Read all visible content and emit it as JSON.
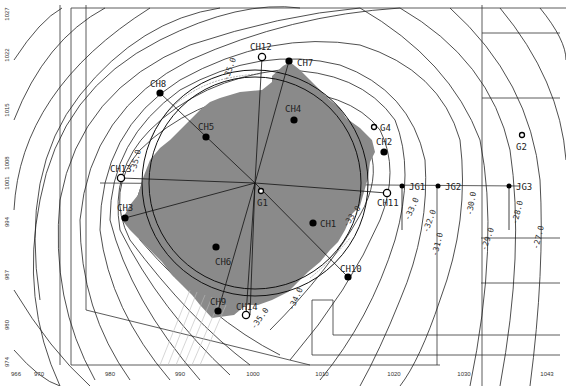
{
  "diagram": {
    "y_axis_ticks": [
      {
        "label": "1027",
        "y": 14
      },
      {
        "label": "1022",
        "y": 55
      },
      {
        "label": "1015",
        "y": 110
      },
      {
        "label": "1008",
        "y": 163
      },
      {
        "label": "1001",
        "y": 183
      },
      {
        "label": "994",
        "y": 222
      },
      {
        "label": "987",
        "y": 275
      },
      {
        "label": "980",
        "y": 325
      },
      {
        "label": "974",
        "y": 362
      }
    ],
    "x_axis_ticks": [
      {
        "label": "966",
        "x": 16
      },
      {
        "label": "970",
        "x": 39
      },
      {
        "label": "980",
        "x": 110
      },
      {
        "label": "990",
        "x": 180
      },
      {
        "label": "1000",
        "x": 253
      },
      {
        "label": "1010",
        "x": 322
      },
      {
        "label": "1020",
        "x": 394
      },
      {
        "label": "1030",
        "x": 464
      },
      {
        "label": "1043",
        "x": 547
      }
    ],
    "contour_labels": [
      {
        "text": "-35.0",
        "x": 232,
        "y": 70,
        "rot": -70
      },
      {
        "text": "-35.0",
        "x": 138,
        "y": 162,
        "rot": -75
      },
      {
        "text": "-33.0",
        "x": 354,
        "y": 218,
        "rot": -55
      },
      {
        "text": "-33.0",
        "x": 414,
        "y": 210,
        "rot": -65
      },
      {
        "text": "-32.0",
        "x": 432,
        "y": 222,
        "rot": -70
      },
      {
        "text": "-31.0",
        "x": 440,
        "y": 245,
        "rot": -75
      },
      {
        "text": "-30.0",
        "x": 474,
        "y": 204,
        "rot": -80
      },
      {
        "text": "-29.0",
        "x": 490,
        "y": 240,
        "rot": -70
      },
      {
        "text": "-28.0",
        "x": 520,
        "y": 213,
        "rot": -75
      },
      {
        "text": "-27.0",
        "x": 541,
        "y": 238,
        "rot": -75
      },
      {
        "text": "-34.0",
        "x": 298,
        "y": 300,
        "rot": -65
      },
      {
        "text": "-35.0",
        "x": 262,
        "y": 320,
        "rot": -55
      }
    ],
    "wells_filled": [
      {
        "name": "CH7",
        "x": 289,
        "y": 61
      },
      {
        "name": "CH8",
        "x": 160,
        "y": 93
      },
      {
        "name": "CH5",
        "x": 206,
        "y": 137
      },
      {
        "name": "CH4",
        "x": 294,
        "y": 120
      },
      {
        "name": "CH2",
        "x": 384,
        "y": 152
      },
      {
        "name": "CH3",
        "x": 125,
        "y": 218
      },
      {
        "name": "CH1",
        "x": 313,
        "y": 223
      },
      {
        "name": "CH6",
        "x": 216,
        "y": 247
      },
      {
        "name": "CH10",
        "x": 348,
        "y": 277
      },
      {
        "name": "CH9",
        "x": 218,
        "y": 311
      },
      {
        "name": "JG1",
        "x": 402,
        "y": 186
      },
      {
        "name": "JG2",
        "x": 438,
        "y": 186
      },
      {
        "name": "JG3",
        "x": 509,
        "y": 186
      }
    ],
    "wells_open": [
      {
        "name": "CH12",
        "x": 262,
        "y": 57
      },
      {
        "name": "CH13",
        "x": 121,
        "y": 178
      },
      {
        "name": "CH11",
        "x": 387,
        "y": 193
      },
      {
        "name": "CH14",
        "x": 246,
        "y": 315
      },
      {
        "name": "G1",
        "x": 261,
        "y": 191
      },
      {
        "name": "G4",
        "x": 374,
        "y": 127
      },
      {
        "name": "G2",
        "x": 522,
        "y": 135
      }
    ],
    "well_labels": [
      {
        "text": "CH12",
        "x": 250,
        "y": 50
      },
      {
        "text": "CH7",
        "x": 297,
        "y": 66
      },
      {
        "text": "CH8",
        "x": 150,
        "y": 87
      },
      {
        "text": "CH5",
        "x": 198,
        "y": 130
      },
      {
        "text": "CH4",
        "x": 285,
        "y": 112
      },
      {
        "text": "G4",
        "x": 380,
        "y": 131
      },
      {
        "text": "CH2",
        "x": 376,
        "y": 145
      },
      {
        "text": "G2",
        "x": 516,
        "y": 150
      },
      {
        "text": "CH13",
        "x": 110,
        "y": 172
      },
      {
        "text": "G1",
        "x": 257,
        "y": 206
      },
      {
        "text": "JG1",
        "x": 409,
        "y": 190
      },
      {
        "text": "JG2",
        "x": 445,
        "y": 190
      },
      {
        "text": "JG3",
        "x": 516,
        "y": 190
      },
      {
        "text": "CH11",
        "x": 377,
        "y": 206
      },
      {
        "text": "CH3",
        "x": 117,
        "y": 211
      },
      {
        "text": "CH1",
        "x": 320,
        "y": 227
      },
      {
        "text": "CH6",
        "x": 215,
        "y": 265
      },
      {
        "text": "CH10",
        "x": 340,
        "y": 272
      },
      {
        "text": "CH9",
        "x": 210,
        "y": 305
      },
      {
        "text": "CH14",
        "x": 236,
        "y": 310
      }
    ],
    "colors": {
      "fill_area": "#8a8a8a",
      "line": "#1a1a1a",
      "background": "#ffffff"
    }
  }
}
